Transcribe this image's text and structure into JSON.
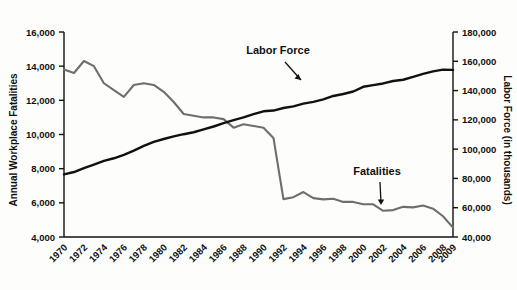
{
  "chart_data": {
    "type": "line",
    "title": "",
    "xlabel": "",
    "x": [
      1970,
      1971,
      1972,
      1973,
      1974,
      1975,
      1976,
      1977,
      1978,
      1979,
      1980,
      1981,
      1982,
      1983,
      1984,
      1985,
      1986,
      1987,
      1988,
      1989,
      1990,
      1991,
      1992,
      1993,
      1994,
      1995,
      1996,
      1997,
      1998,
      1999,
      2000,
      2001,
      2002,
      2003,
      2004,
      2005,
      2006,
      2007,
      2008,
      2009
    ],
    "x_tick_labels": [
      "1970",
      "1972",
      "1974",
      "1976",
      "1978",
      "1980",
      "1982",
      "1984",
      "1986",
      "1988",
      "1990",
      "1992",
      "1994",
      "1996",
      "1998",
      "2000",
      "2002",
      "2004",
      "2006",
      "2008",
      "2009"
    ],
    "grid": false,
    "legend": "none",
    "annotations": [
      {
        "text": "Labor Force",
        "target_series": "Labor Force",
        "arrow": "down-right"
      },
      {
        "text": "Fatalities",
        "target_series": "Annual Workplace Fatalities",
        "arrow": "down"
      }
    ],
    "axes": [
      {
        "id": "left",
        "label": "Annual Workplace Fatalities",
        "ylim": [
          4000,
          16000
        ],
        "ticks": [
          4000,
          6000,
          8000,
          10000,
          12000,
          14000,
          16000
        ],
        "tick_labels": [
          "4,000",
          "6,000",
          "8,000",
          "10,000",
          "12,000",
          "14,000",
          "16,000"
        ]
      },
      {
        "id": "right",
        "label": "Labor Force (in thousands)",
        "ylim": [
          40000,
          180000
        ],
        "ticks": [
          40000,
          60000,
          80000,
          100000,
          120000,
          140000,
          160000,
          180000
        ],
        "tick_labels": [
          "40,000",
          "60,000",
          "80,000",
          "100,000",
          "120,000",
          "140,000",
          "160,000",
          "180,000"
        ]
      }
    ],
    "series": [
      {
        "name": "Annual Workplace Fatalities",
        "axis": "left",
        "color": "#6e6e6e",
        "values": [
          13800,
          13600,
          14300,
          14000,
          13000,
          12600,
          12200,
          12900,
          13000,
          12900,
          12500,
          11900,
          11200,
          11100,
          11000,
          11000,
          10900,
          10400,
          10600,
          10500,
          10400,
          9800,
          6217,
          6331,
          6632,
          6275,
          6202,
          6238,
          6055,
          6054,
          5920,
          5915,
          5534,
          5575,
          5764,
          5734,
          5840,
          5657,
          5214,
          4551
        ]
      },
      {
        "name": "Labor Force",
        "axis": "right",
        "color": "#111111",
        "values": [
          82771,
          84382,
          87034,
          89429,
          91949,
          93775,
          96158,
          99009,
          102251,
          104962,
          106940,
          108670,
          110204,
          111550,
          113544,
          115461,
          117834,
          119865,
          121669,
          123869,
          125840,
          126346,
          128105,
          129200,
          131056,
          132304,
          133943,
          136297,
          137673,
          139368,
          142583,
          143734,
          144863,
          146510,
          147401,
          149320,
          151428,
          153124,
          154287,
          154142
        ]
      }
    ]
  },
  "labels": {
    "left_axis_title": "Annual Workplace Fatalities",
    "right_axis_title": "Labor Force (in thousands)",
    "annotation_labor_force": "Labor Force",
    "annotation_fatalities": "Fatalities"
  }
}
